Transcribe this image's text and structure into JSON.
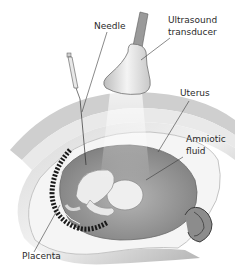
{
  "diagram": {
    "labels": {
      "needle": "Needle",
      "ultrasound_line1": "Ultrasound",
      "ultrasound_line2": "transducer",
      "uterus": "Uterus",
      "amniotic_line1": "Amniotic",
      "amniotic_line2": "fluid",
      "placenta": "Placenta"
    },
    "colors": {
      "background": "#ffffff",
      "line": "#3a3a3a",
      "uterus_wall": "#e6e6e6",
      "uterus_shadow": "#b8b8b8",
      "amniotic_sac": "#9a9a9a",
      "fetus": "#efefef",
      "placenta": "#1a1a1a",
      "transducer": "#dcdcdc"
    }
  }
}
